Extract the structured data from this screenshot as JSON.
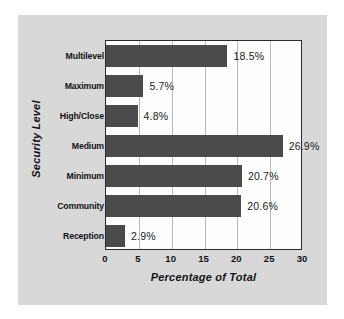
{
  "chart_data": {
    "type": "bar",
    "orientation": "horizontal",
    "title": "",
    "xlabel": "Percentage of Total",
    "ylabel": "Security Level",
    "xlim": [
      0,
      30
    ],
    "xticks": [
      0,
      5,
      10,
      15,
      20,
      25,
      30
    ],
    "grid": true,
    "legend": false,
    "categories": [
      "Multilevel",
      "Maximum",
      "High/Close",
      "Medium",
      "Minimum",
      "Community",
      "Reception"
    ],
    "values": [
      18.5,
      5.7,
      4.8,
      26.9,
      20.7,
      20.6,
      2.9
    ],
    "value_labels": [
      "18.5%",
      "5.7%",
      "4.8%",
      "26.9%",
      "20.7%",
      "20.6%",
      "2.9%"
    ],
    "bar_color": "#4b4b4b",
    "plot_background": "#fdfdfd",
    "card_background": "#d8d8d8",
    "grid_color": "#b9b9b9",
    "axis_color": "#2b2b2b"
  }
}
